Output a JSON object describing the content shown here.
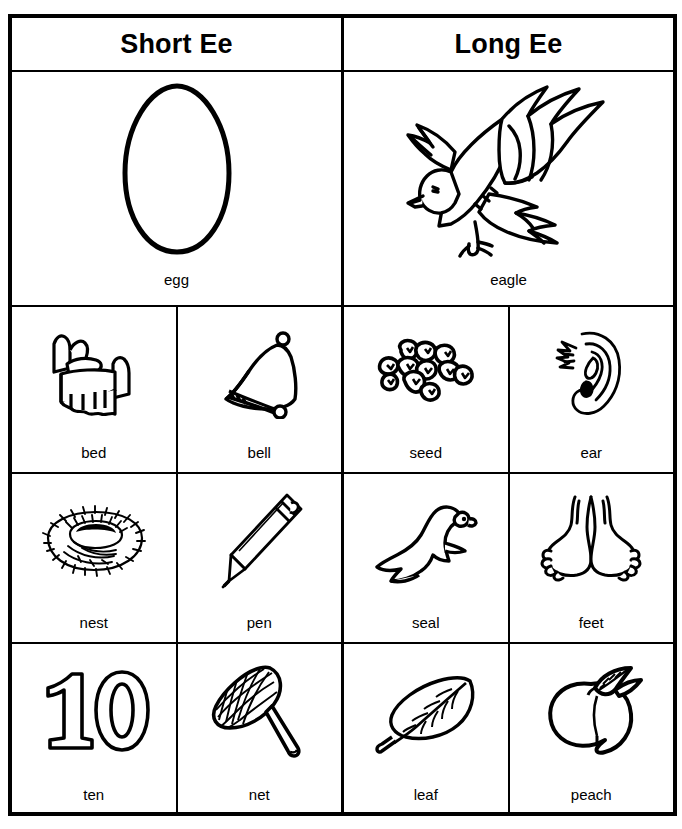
{
  "worksheet": {
    "title_left": "Short Ee",
    "title_right": "Long Ee",
    "featured": {
      "short": {
        "label": "egg",
        "icon": "egg-outline-icon"
      },
      "long": {
        "label": "eagle",
        "icon": "eagle-flying-icon"
      }
    },
    "rows": [
      {
        "cells": [
          {
            "label": "bed",
            "icon": "bed-icon",
            "group": "short"
          },
          {
            "label": "bell",
            "icon": "bell-icon",
            "group": "short"
          },
          {
            "label": "seed",
            "icon": "seeds-icon",
            "group": "long"
          },
          {
            "label": "ear",
            "icon": "ear-icon",
            "group": "long"
          }
        ]
      },
      {
        "cells": [
          {
            "label": "nest",
            "icon": "nest-icon",
            "group": "short"
          },
          {
            "label": "pen",
            "icon": "pen-icon",
            "group": "short"
          },
          {
            "label": "seal",
            "icon": "seal-icon",
            "group": "long"
          },
          {
            "label": "feet",
            "icon": "feet-icon",
            "group": "long"
          }
        ]
      },
      {
        "cells": [
          {
            "label": "ten",
            "icon": "number-ten-icon",
            "group": "short"
          },
          {
            "label": "net",
            "icon": "net-icon",
            "group": "short"
          },
          {
            "label": "leaf",
            "icon": "leaf-icon",
            "group": "long"
          },
          {
            "label": "peach",
            "icon": "peach-icon",
            "group": "long"
          }
        ]
      }
    ],
    "colors": {
      "ink": "#000000",
      "paper": "#ffffff"
    }
  }
}
